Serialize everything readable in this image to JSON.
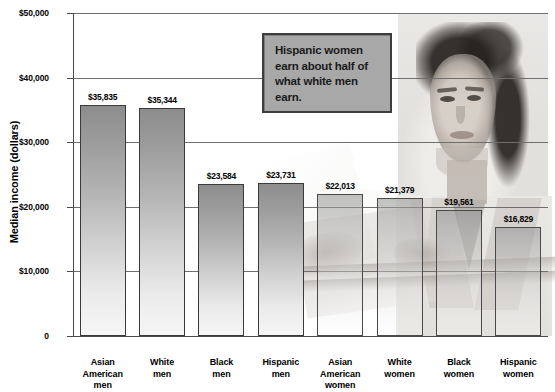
{
  "chart_data": {
    "type": "bar",
    "title": "",
    "xlabel": "",
    "ylabel": "Median income (dollars)",
    "ylim": [
      0,
      50000
    ],
    "ytick_values": [
      50000,
      40000,
      30000,
      20000,
      10000,
      0
    ],
    "ytick_labels": [
      "$50,000",
      "$40,000",
      "$30,000",
      "$20,000",
      "$10,000",
      "0"
    ],
    "grid": true,
    "legend": "none",
    "categories": [
      "Asian American men",
      "White men",
      "Black men",
      "Hispanic men",
      "Asian American women",
      "White women",
      "Black women",
      "Hispanic women"
    ],
    "values": [
      35835,
      35344,
      23584,
      23731,
      22013,
      21379,
      19561,
      16829
    ],
    "value_labels": [
      "$35,835",
      "$35,344",
      "$23,584",
      "$23,731",
      "$22,013",
      "$21,379",
      "$19,561",
      "$16,829"
    ],
    "annotation": "Hispanic women earn about half of what white men earn."
  },
  "axis": {
    "y_title": "Median income (dollars)",
    "ticks": [
      {
        "label": "$50,000",
        "value": 50000
      },
      {
        "label": "$40,000",
        "value": 40000
      },
      {
        "label": "$30,000",
        "value": 30000
      },
      {
        "label": "$20,000",
        "value": 20000
      },
      {
        "label": "$10,000",
        "value": 10000
      },
      {
        "label": "0",
        "value": 0
      }
    ]
  },
  "bars": [
    {
      "label_line1": "Asian",
      "label_line2": "American",
      "label_line3": "men",
      "value_label": "$35,835",
      "value": 35835
    },
    {
      "label_line1": "White",
      "label_line2": "men",
      "label_line3": "",
      "value_label": "$35,344",
      "value": 35344
    },
    {
      "label_line1": "Black",
      "label_line2": "men",
      "label_line3": "",
      "value_label": "$23,584",
      "value": 23584
    },
    {
      "label_line1": "Hispanic",
      "label_line2": "men",
      "label_line3": "",
      "value_label": "$23,731",
      "value": 23731
    },
    {
      "label_line1": "Asian",
      "label_line2": "American",
      "label_line3": "women",
      "value_label": "$22,013",
      "value": 22013
    },
    {
      "label_line1": "White",
      "label_line2": "women",
      "label_line3": "",
      "value_label": "$21,379",
      "value": 21379
    },
    {
      "label_line1": "Black",
      "label_line2": "women",
      "label_line3": "",
      "value_label": "$19,561",
      "value": 19561
    },
    {
      "label_line1": "Hispanic",
      "label_line2": "women",
      "label_line3": "",
      "value_label": "$16,829",
      "value": 16829
    }
  ],
  "callout": {
    "text": "Hispanic women earn about half of what white men earn."
  },
  "colors": {
    "bar_top": "#8d8d8d",
    "bar_bottom": "#f6f6f6",
    "bar_border": "#3a3a3a",
    "grid": "#6e6e6e",
    "axis": "#4a4a4a",
    "callout_bg": "#a8a8a8",
    "callout_border": "#3d3d3d",
    "text": "#000000"
  }
}
